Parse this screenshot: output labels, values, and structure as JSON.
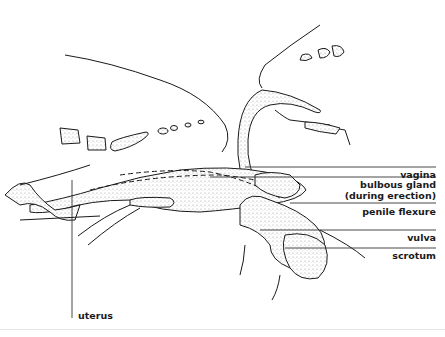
{
  "figure": {
    "labels": [
      {
        "id": "vagina",
        "text": "vagina"
      },
      {
        "id": "bulbous_gland",
        "text": "bulbous gland",
        "subtext": "(during erection)"
      },
      {
        "id": "penile_flexure",
        "text": "penile flexure"
      },
      {
        "id": "vulva",
        "text": "vulva"
      },
      {
        "id": "scrotum",
        "text": "scrotum"
      },
      {
        "id": "uterus",
        "text": "uterus"
      }
    ]
  },
  "colors": {
    "ink": "#1a1a1a",
    "stipple": "#9a9a9a",
    "background": "#ffffff"
  }
}
